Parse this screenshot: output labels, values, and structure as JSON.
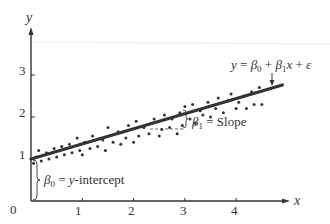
{
  "chart_data": {
    "type": "scatter",
    "title": "",
    "xlabel": "x",
    "ylabel": "y",
    "xlim": [
      0,
      4.9
    ],
    "ylim": [
      0,
      3.6
    ],
    "grid": false,
    "x_ticks": [
      {
        "value": 0,
        "label": "0"
      },
      {
        "value": 1,
        "label": "1"
      },
      {
        "value": 2,
        "label": "2"
      },
      {
        "value": 3,
        "label": "3"
      },
      {
        "value": 4,
        "label": "4"
      }
    ],
    "y_ticks": [
      {
        "value": 1,
        "label": "1"
      },
      {
        "value": 2,
        "label": "2"
      },
      {
        "value": 3,
        "label": "3"
      }
    ],
    "regression_line": {
      "intercept": 1.0,
      "slope": 0.36,
      "x_start": 0,
      "x_end": 4.9,
      "label": "y = β0 + β1x + ε",
      "color": "#333333"
    },
    "series": [
      {
        "name": "observations",
        "points": [
          [
            0.05,
            0.9
          ],
          [
            0.1,
            1.05
          ],
          [
            0.15,
            1.2
          ],
          [
            0.2,
            0.95
          ],
          [
            0.3,
            1.15
          ],
          [
            0.35,
            1.0
          ],
          [
            0.45,
            1.25
          ],
          [
            0.5,
            1.05
          ],
          [
            0.6,
            1.3
          ],
          [
            0.65,
            1.1
          ],
          [
            0.75,
            1.35
          ],
          [
            0.8,
            1.15
          ],
          [
            0.9,
            1.5
          ],
          [
            0.95,
            1.2
          ],
          [
            1.0,
            1.1
          ],
          [
            1.05,
            1.4
          ],
          [
            1.15,
            1.25
          ],
          [
            1.2,
            1.55
          ],
          [
            1.3,
            1.3
          ],
          [
            1.4,
            1.45
          ],
          [
            1.45,
            1.2
          ],
          [
            1.5,
            1.75
          ],
          [
            1.6,
            1.4
          ],
          [
            1.7,
            1.65
          ],
          [
            1.75,
            1.35
          ],
          [
            1.85,
            1.5
          ],
          [
            1.9,
            1.8
          ],
          [
            2.0,
            1.4
          ],
          [
            2.05,
            1.9
          ],
          [
            2.1,
            1.55
          ],
          [
            2.2,
            1.75
          ],
          [
            2.3,
            1.6
          ],
          [
            2.35,
            1.85
          ],
          [
            2.4,
            1.95
          ],
          [
            2.5,
            1.55
          ],
          [
            2.55,
            1.7
          ],
          [
            2.6,
            2.05
          ],
          [
            2.7,
            1.75
          ],
          [
            2.75,
            1.95
          ],
          [
            2.85,
            1.6
          ],
          [
            2.9,
            2.1
          ],
          [
            2.95,
            1.8
          ],
          [
            3.0,
            2.25
          ],
          [
            3.1,
            1.95
          ],
          [
            3.15,
            2.3
          ],
          [
            3.2,
            1.85
          ],
          [
            3.3,
            2.15
          ],
          [
            3.35,
            2.05
          ],
          [
            3.45,
            2.35
          ],
          [
            3.5,
            2.0
          ],
          [
            3.6,
            2.2
          ],
          [
            3.65,
            2.45
          ],
          [
            3.75,
            2.1
          ],
          [
            3.85,
            2.4
          ],
          [
            3.9,
            2.55
          ],
          [
            4.0,
            2.2
          ],
          [
            4.05,
            2.35
          ],
          [
            4.15,
            2.5
          ],
          [
            4.2,
            2.2
          ],
          [
            4.3,
            2.6
          ],
          [
            4.35,
            2.3
          ],
          [
            4.45,
            2.7
          ],
          [
            4.5,
            2.3
          ]
        ]
      }
    ],
    "annotations": [
      {
        "text": "y = β0 + β1x + ε",
        "target": "regression_line",
        "arrow": "down",
        "x": 4.5,
        "y": 3.1
      },
      {
        "text": "β1 = Slope",
        "target": "slope_triangle",
        "x_from": 2.3,
        "x_to": 3.0
      },
      {
        "text": "β0 = y-intercept",
        "target": "intercept_bracket",
        "y_from": 0,
        "y_to": 1.0
      }
    ]
  },
  "labels": {
    "y_axis": "y",
    "x_axis": "x",
    "origin": "0",
    "equation_y": "y",
    "equation_eq": " = ",
    "beta": "β",
    "sub0": "0",
    "sub1": "1",
    "plus": " + ",
    "x_var": "x",
    "epsilon": "ε",
    "slope_eq": " = Slope",
    "intercept_eq": " = ",
    "intercept_text": "y",
    "intercept_suffix": "-intercept"
  }
}
